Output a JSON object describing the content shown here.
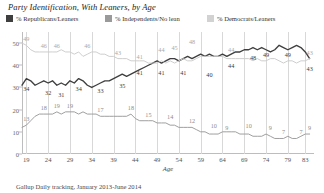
{
  "chart_data": {
    "type": "line",
    "title": "Party Identification, With Leaners, by Age",
    "xlabel": "Age",
    "ylabel": "",
    "source": "Gallup Daily tracking, January 2013-June 2014",
    "grid": true,
    "legend_position": "top",
    "xlim": [
      18,
      85
    ],
    "ylim": [
      0,
      55
    ],
    "yticks": [
      0,
      10,
      20,
      30,
      40,
      50
    ],
    "xticks": [
      19,
      24,
      29,
      34,
      39,
      44,
      49,
      54,
      59,
      64,
      69,
      74,
      79,
      83
    ],
    "x": [
      18,
      19,
      20,
      21,
      22,
      23,
      24,
      25,
      26,
      27,
      28,
      29,
      30,
      31,
      32,
      33,
      34,
      35,
      36,
      37,
      38,
      39,
      40,
      41,
      42,
      43,
      44,
      45,
      46,
      47,
      48,
      49,
      50,
      51,
      52,
      53,
      54,
      55,
      56,
      57,
      58,
      59,
      60,
      61,
      62,
      63,
      64,
      65,
      66,
      67,
      68,
      69,
      70,
      71,
      72,
      73,
      74,
      75,
      76,
      77,
      78,
      79,
      80,
      81,
      82,
      83,
      84
    ],
    "series": [
      {
        "name": "% Republicans/Leaners",
        "color": "#3f3f3f",
        "values": [
          31,
          34,
          33,
          31,
          32,
          33,
          32,
          33,
          31,
          32,
          31,
          33,
          32,
          34,
          33,
          31,
          30,
          31,
          32,
          33,
          33,
          34,
          35,
          36,
          35,
          36,
          37,
          38,
          39,
          40,
          41,
          42,
          41,
          42,
          43,
          43,
          42,
          43,
          44,
          43,
          44,
          45,
          44,
          45,
          44,
          44,
          45,
          44,
          45,
          46,
          46,
          47,
          47,
          48,
          47,
          48,
          47,
          46,
          47,
          49,
          48,
          47,
          48,
          49,
          48,
          46,
          43
        ]
      },
      {
        "name": "% Independents/No lean",
        "color": "#9a9a9a",
        "values": [
          12,
          13,
          15,
          17,
          18,
          18,
          18,
          18,
          19,
          18,
          19,
          19,
          19,
          18,
          19,
          18,
          18,
          18,
          17,
          17,
          17,
          17,
          17,
          17,
          17,
          18,
          16,
          15,
          15,
          15,
          15,
          14,
          14,
          14,
          13,
          13,
          12,
          12,
          12,
          12,
          11,
          10,
          10,
          9,
          9,
          9,
          10,
          10,
          10,
          10,
          9,
          9,
          9,
          8,
          8,
          8,
          9,
          8,
          7,
          7,
          7,
          8,
          7,
          7,
          8,
          9,
          9
        ]
      },
      {
        "name": "% Democrats/Leaners",
        "color": "#cbcbcb",
        "values": [
          50,
          49,
          47,
          46,
          46,
          46,
          46,
          46,
          46,
          47,
          46,
          46,
          45,
          46,
          44,
          45,
          46,
          46,
          45,
          45,
          44,
          44,
          43,
          43,
          43,
          42,
          42,
          42,
          42,
          41,
          41,
          41,
          42,
          41,
          42,
          41,
          42,
          43,
          42,
          42,
          43,
          44,
          44,
          44,
          44,
          44,
          44,
          43,
          43,
          43,
          43,
          43,
          43,
          42,
          43,
          42,
          42,
          43,
          43,
          42,
          41,
          42,
          42,
          41,
          42,
          42,
          43
        ]
      }
    ],
    "point_labels": [
      {
        "series": "rep",
        "x": 19,
        "value": 34,
        "text": "34"
      },
      {
        "series": "rep",
        "x": 24,
        "value": 32,
        "text": "32"
      },
      {
        "series": "rep",
        "x": 27,
        "value": 31,
        "text": "31"
      },
      {
        "series": "rep",
        "x": 31,
        "value": 34,
        "text": "34"
      },
      {
        "series": "rep",
        "x": 36,
        "value": 33,
        "text": "33"
      },
      {
        "series": "rep",
        "x": 41,
        "value": 35,
        "text": "35"
      },
      {
        "series": "rep",
        "x": 45,
        "value": 41,
        "text": "41"
      },
      {
        "series": "rep",
        "x": 50,
        "value": 41,
        "text": "41"
      },
      {
        "series": "rep",
        "x": 55,
        "value": 41,
        "text": "41"
      },
      {
        "series": "rep",
        "x": 61,
        "value": 40,
        "text": "40"
      },
      {
        "series": "rep",
        "x": 66,
        "value": 44,
        "text": "44"
      },
      {
        "series": "rep",
        "x": 71,
        "value": 48,
        "text": "48"
      },
      {
        "series": "rep",
        "x": 74,
        "value": 49,
        "text": "49"
      },
      {
        "series": "rep",
        "x": 79,
        "value": 49,
        "text": "49"
      },
      {
        "series": "rep",
        "x": 84,
        "value": 43,
        "text": "43"
      },
      {
        "series": "ind",
        "x": 19,
        "value": 13,
        "text": "13"
      },
      {
        "series": "ind",
        "x": 23,
        "value": 18,
        "text": "18"
      },
      {
        "series": "ind",
        "x": 26,
        "value": 19,
        "text": "19"
      },
      {
        "series": "ind",
        "x": 29,
        "value": 19,
        "text": "19"
      },
      {
        "series": "ind",
        "x": 36,
        "value": 17,
        "text": "17"
      },
      {
        "series": "ind",
        "x": 43,
        "value": 18,
        "text": "18"
      },
      {
        "series": "ind",
        "x": 47,
        "value": 15,
        "text": "15"
      },
      {
        "series": "ind",
        "x": 52,
        "value": 14,
        "text": "14"
      },
      {
        "series": "ind",
        "x": 57,
        "value": 12,
        "text": "12"
      },
      {
        "series": "ind",
        "x": 62,
        "value": 10,
        "text": "10"
      },
      {
        "series": "ind",
        "x": 65,
        "value": 9,
        "text": "9"
      },
      {
        "series": "ind",
        "x": 70,
        "value": 10,
        "text": "10"
      },
      {
        "series": "ind",
        "x": 75,
        "value": 9,
        "text": "9"
      },
      {
        "series": "ind",
        "x": 78,
        "value": 7,
        "text": "7"
      },
      {
        "series": "ind",
        "x": 82,
        "value": 7,
        "text": "7"
      },
      {
        "series": "ind",
        "x": 84,
        "value": 9,
        "text": "9"
      },
      {
        "series": "dem",
        "x": 19,
        "value": 49,
        "text": "49"
      },
      {
        "series": "dem",
        "x": 23,
        "value": 46,
        "text": "46"
      },
      {
        "series": "dem",
        "x": 26,
        "value": 46,
        "text": "46"
      },
      {
        "series": "dem",
        "x": 33,
        "value": 46,
        "text": "46"
      },
      {
        "series": "dem",
        "x": 40,
        "value": 43,
        "text": "43"
      },
      {
        "series": "dem",
        "x": 45,
        "value": 41,
        "text": "41"
      },
      {
        "series": "dem",
        "x": 50,
        "value": 44,
        "text": "44"
      },
      {
        "series": "dem",
        "x": 53,
        "value": 45,
        "text": "45"
      },
      {
        "series": "dem",
        "x": 57,
        "value": 48,
        "text": "48"
      },
      {
        "series": "dem",
        "x": 66,
        "value": 44,
        "text": "44"
      },
      {
        "series": "dem",
        "x": 84,
        "value": 43,
        "text": "43"
      }
    ]
  },
  "legend": {
    "items": [
      {
        "label": "% Republicans/Leaners",
        "color": "#3f3f3f"
      },
      {
        "label": "% Independents/No lean",
        "color": "#9a9a9a"
      },
      {
        "label": "% Democrats/Leaners",
        "color": "#d2d2d2"
      }
    ]
  }
}
